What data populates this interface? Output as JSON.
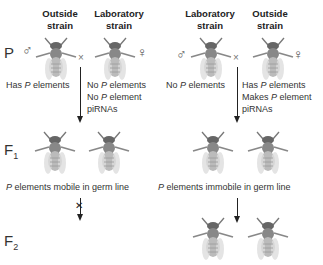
{
  "left_cross": {
    "parent1": {
      "label_line1": "Outside",
      "label_line2": "strain",
      "sex": "♂",
      "note": [
        "Has P elements"
      ]
    },
    "parent2": {
      "label_line1": "Laboratory",
      "label_line2": "strain",
      "sex": "♀",
      "note": [
        "No P elements",
        "No P element",
        "piRNAs"
      ]
    },
    "cross_symbol": "×",
    "f1_note": "P elements mobile in germ line",
    "f2_result": "blocked"
  },
  "right_cross": {
    "parent1": {
      "label_line1": "Laboratory",
      "label_line2": "strain",
      "sex": "♂",
      "note": [
        "No P elements"
      ]
    },
    "parent2": {
      "label_line1": "Outside",
      "label_line2": "strain",
      "sex": "♀",
      "note": [
        "Has P elements",
        "Makes P element",
        "piRNAs"
      ]
    },
    "cross_symbol": "×",
    "f1_note": "P elements immobile in germ line",
    "f2_result": "normal"
  },
  "generations": {
    "p": "P",
    "f1": "F",
    "f1_sub": "1",
    "f2": "F",
    "f2_sub": "2"
  }
}
